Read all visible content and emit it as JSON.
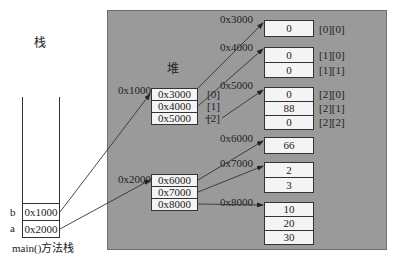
{
  "stack": {
    "title": "栈",
    "caption": "main()方法栈",
    "vars": [
      {
        "name": "b",
        "value": "0x1000"
      },
      {
        "name": "a",
        "value": "0x2000"
      }
    ]
  },
  "heap": {
    "title": "堆",
    "outer_arrays": [
      {
        "address": "0x1000",
        "cells": [
          "0x3000",
          "0x4000",
          "0x5000"
        ],
        "indices": [
          "[0]",
          "[1]",
          "[2]"
        ]
      },
      {
        "address": "0x2000",
        "cells": [
          "0x6000",
          "0x7000",
          "0x8000"
        ]
      }
    ],
    "inner_arrays": [
      {
        "address": "0x3000",
        "cells": [
          "0"
        ],
        "indices": [
          "[0][0]"
        ]
      },
      {
        "address": "0x4000",
        "cells": [
          "0",
          "0"
        ],
        "indices": [
          "[1][0]",
          "[1][1]"
        ]
      },
      {
        "address": "0x5000",
        "cells": [
          "0",
          "88",
          "0"
        ],
        "indices": [
          "[2][0]",
          "[2][1]",
          "[2][2]"
        ]
      },
      {
        "address": "0x6000",
        "cells": [
          "66"
        ]
      },
      {
        "address": "0x7000",
        "cells": [
          "2",
          "3"
        ]
      },
      {
        "address": "0x8000",
        "cells": [
          "10",
          "20",
          "30"
        ]
      }
    ]
  },
  "colors": {
    "heap_bg": "#9a9a9a",
    "cell_bg": "#f4f4f4",
    "line": "#333333"
  }
}
